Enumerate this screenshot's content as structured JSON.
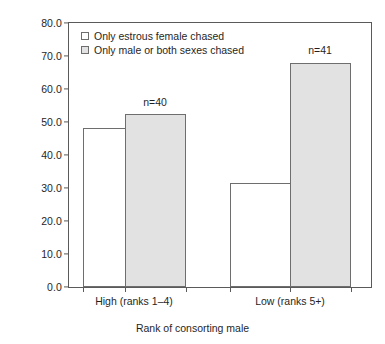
{
  "chart_data": {
    "type": "bar",
    "title": "",
    "xlabel": "Rank of consorting male",
    "ylabel": "% of approaches per consortships",
    "categories": [
      "High (ranks 1–4)",
      "Low (ranks 5+)"
    ],
    "series": [
      {
        "name": "Only estrous female chased",
        "values": [
          48.1,
          31.6
        ],
        "swatch": "open",
        "color": "#ffffff"
      },
      {
        "name": "Only male or both sexes chased",
        "values": [
          52.3,
          68.0
        ],
        "swatch": "filled",
        "color": "#e2e2e2"
      }
    ],
    "ylim": [
      0.0,
      80.0
    ],
    "yticks": [
      "0.0",
      "10.0",
      "20.0",
      "30.0",
      "40.0",
      "50.0",
      "60.0",
      "70.0",
      "80.0"
    ],
    "ytick_values": [
      0,
      10,
      20,
      30,
      40,
      50,
      60,
      70,
      80
    ],
    "grid": false,
    "legend_position": "top-left-inside",
    "annotations": [
      {
        "text": "n=40",
        "group": "High (ranks 1–4)"
      },
      {
        "text": "n=41",
        "group": "Low (ranks 5+)"
      }
    ]
  },
  "axes": {
    "y_title": "% of approaches per consortships",
    "x_title": "Rank of consorting male",
    "y_ticks": [
      "80.0",
      "70.0",
      "60.0",
      "50.0",
      "40.0",
      "30.0",
      "20.0",
      "10.0",
      "0.0"
    ],
    "x_labels": [
      "High (ranks 1–4)",
      "Low (ranks 5+)"
    ]
  },
  "legend": {
    "items": [
      {
        "label": "Only estrous female chased"
      },
      {
        "label": "Only male or both sexes chased"
      }
    ]
  },
  "annotations": {
    "n_high": "n=40",
    "n_low": "n=41"
  },
  "colors": {
    "axis": "#5a5a5a",
    "bar_outline": "#6e6e6e",
    "bar_open_fill": "#ffffff",
    "bar_filled_fill": "#e2e2e2",
    "text": "#1f1f1f"
  }
}
